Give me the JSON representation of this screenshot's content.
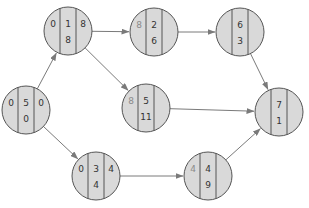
{
  "diagram": {
    "type": "activity-network",
    "colors": {
      "node_fill": "#d9d9d9",
      "node_stroke": "#555555",
      "edge": "#7a7a7a",
      "text": "#333333",
      "faded_text": "#8a8a8a",
      "background": "#ffffff"
    },
    "node_radius": 24,
    "nodes": [
      {
        "id": "A",
        "cx": 26,
        "cy": 110,
        "left": "0",
        "top": "5",
        "right": "0",
        "bottom": "0",
        "left_faded": false
      },
      {
        "id": "B",
        "cx": 68,
        "cy": 31,
        "left": "0",
        "top": "1",
        "right": "8",
        "bottom": "8",
        "left_faded": false
      },
      {
        "id": "C",
        "cx": 154,
        "cy": 32,
        "left": "8",
        "top": "2",
        "right": "",
        "bottom": "6",
        "left_faded": true
      },
      {
        "id": "D",
        "cx": 240,
        "cy": 32,
        "left": "",
        "top": "6",
        "right": "",
        "bottom": "3",
        "left_faded": false
      },
      {
        "id": "E",
        "cx": 146,
        "cy": 108,
        "left": "8",
        "top": "5",
        "right": "",
        "bottom": "11",
        "left_faded": true
      },
      {
        "id": "F",
        "cx": 96,
        "cy": 176,
        "left": "0",
        "top": "3",
        "right": "4",
        "bottom": "4",
        "left_faded": false
      },
      {
        "id": "G",
        "cx": 208,
        "cy": 176,
        "left": "4",
        "top": "4",
        "right": "",
        "bottom": "9",
        "left_faded": true
      },
      {
        "id": "H",
        "cx": 279,
        "cy": 112,
        "left": "",
        "top": "7",
        "right": "",
        "bottom": "1",
        "left_faded": false
      }
    ],
    "edges": [
      {
        "from": "A",
        "to": "B"
      },
      {
        "from": "A",
        "to": "F"
      },
      {
        "from": "B",
        "to": "C"
      },
      {
        "from": "B",
        "to": "E"
      },
      {
        "from": "C",
        "to": "D"
      },
      {
        "from": "D",
        "to": "H"
      },
      {
        "from": "E",
        "to": "H"
      },
      {
        "from": "F",
        "to": "G"
      },
      {
        "from": "G",
        "to": "H"
      }
    ]
  }
}
